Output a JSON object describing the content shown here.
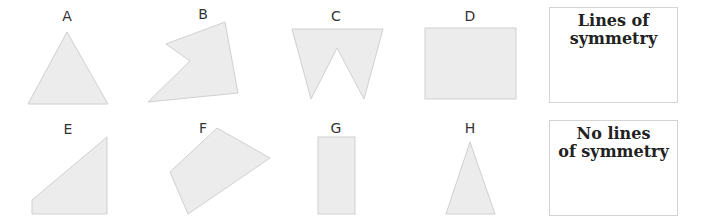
{
  "shapes": [
    {
      "label": "A",
      "type": "equilateral-triangle"
    },
    {
      "label": "B",
      "type": "irregular-concave-pentagon"
    },
    {
      "label": "C",
      "type": "w-shape"
    },
    {
      "label": "D",
      "type": "rectangle"
    },
    {
      "label": "E",
      "type": "right-trapezoid"
    },
    {
      "label": "F",
      "type": "irregular-quadrilateral"
    },
    {
      "label": "G",
      "type": "tall-rectangle"
    },
    {
      "label": "H",
      "type": "isosceles-triangle"
    }
  ],
  "boxes": {
    "lines": {
      "line1": "Lines of",
      "line2": "symmetry"
    },
    "none": {
      "line1": "No lines",
      "line2": "of symmetry"
    }
  },
  "colors": {
    "fill": "#ececec",
    "stroke": "#d0d0d0",
    "box_border": "#d4d4d4"
  }
}
